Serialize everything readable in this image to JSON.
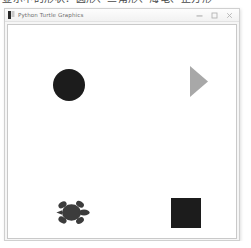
{
  "background_window": {
    "clipped_text": "显示中的形状：圆形、三角形、海龟、正方形"
  },
  "window": {
    "title": "Python Turtle Graphics",
    "app_icon_name": "python-turtle-icon",
    "controls": {
      "minimize_label": "—",
      "maximize_label": "□",
      "close_label": "✕"
    }
  },
  "canvas": {
    "background_color": "#ffffff",
    "border_color": "#c9c9c9",
    "shapes": [
      {
        "name": "circle",
        "label": "circle",
        "color": "#1c1c1c",
        "x": 45,
        "y": 44,
        "width": 32,
        "height": 32
      },
      {
        "name": "triangle",
        "label": "triangle",
        "color": "#a8a8a8",
        "x": 182,
        "y": 41,
        "width": 18,
        "height": 31
      },
      {
        "name": "turtle",
        "label": "turtle",
        "color": "#3c3c3c",
        "x": 48,
        "y": 174,
        "width": 34,
        "height": 27
      },
      {
        "name": "square",
        "label": "square",
        "color": "#1c1c1c",
        "x": 163,
        "y": 173,
        "width": 30,
        "height": 30
      }
    ]
  }
}
